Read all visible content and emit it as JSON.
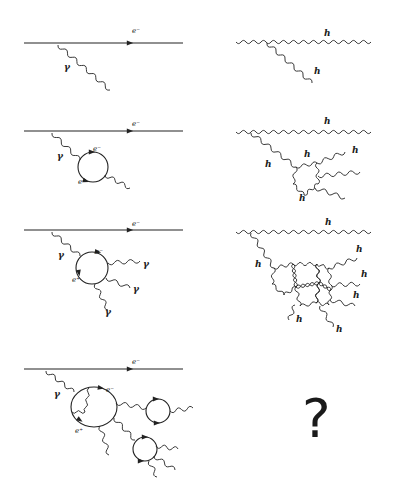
{
  "figure": {
    "left_column": [
      {
        "id": "qed-1",
        "labels": {
          "electron": "e⁻",
          "photon": "γ"
        }
      },
      {
        "id": "qed-2",
        "labels": {
          "electron": "e⁻",
          "photon": "γ",
          "loop_electron": "e⁻",
          "loop_positron": "e⁺"
        }
      },
      {
        "id": "qed-3",
        "labels": {
          "electron": "e⁻",
          "photon": "γ",
          "loop_electron": "e⁻",
          "loop_positron": "e⁺",
          "out_photon_1": "γ",
          "out_photon_2": "γ",
          "out_photon_3": "γ"
        }
      },
      {
        "id": "qed-4",
        "labels": {
          "electron": "e⁻",
          "photon": "γ",
          "loop_electron": "e⁻",
          "loop_positron": "e⁺"
        }
      }
    ],
    "right_column": [
      {
        "id": "grav-1",
        "labels": {
          "main": "h",
          "branch": "h"
        }
      },
      {
        "id": "grav-2",
        "labels": {
          "main": "h",
          "branch": "h",
          "loop_top": "h",
          "loop_bottom": "h",
          "out_1": "h"
        }
      },
      {
        "id": "grav-3",
        "labels": {
          "main": "h",
          "branch": "h",
          "out_1": "h",
          "out_2": "h",
          "out_3": "h",
          "out_4": "h",
          "out_5": "h"
        }
      },
      {
        "id": "grav-4",
        "labels": {
          "unknown": "?"
        }
      }
    ]
  }
}
